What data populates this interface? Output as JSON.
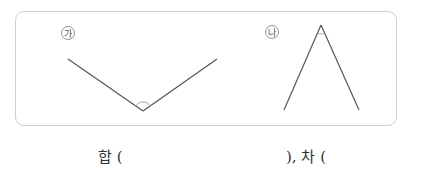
{
  "figures": [
    {
      "label": "㉮",
      "type": "obtuse-angle",
      "vertex": [
        143,
        111
      ],
      "arm1_end": [
        68,
        59
      ],
      "arm2_end": [
        217,
        59
      ]
    },
    {
      "label": "㉯",
      "type": "acute-angle",
      "vertex": [
        321,
        25
      ],
      "arm1_end": [
        284,
        110
      ],
      "arm2_end": [
        359,
        110
      ]
    }
  ],
  "answer_line": {
    "sum_label": "합 (",
    "diff_label": "), 차 ("
  },
  "colors": {
    "line": "#555555",
    "border": "#cfcfcf",
    "arc": "#999999"
  }
}
